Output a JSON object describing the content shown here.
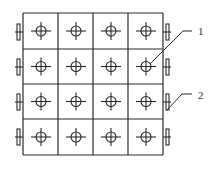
{
  "diagram": {
    "type": "grid-array",
    "rows": 4,
    "cols": 4,
    "stroke_color": "#2a2a2a",
    "background": "#ffffff",
    "grid": {
      "x_lines": [
        23,
        58,
        93,
        128,
        163
      ],
      "y_lines": [
        13,
        49,
        84,
        119,
        155
      ]
    },
    "cell_symbol": "circle-crosshair-icon",
    "edge_connectors": {
      "left_y": [
        32,
        67,
        102,
        137
      ],
      "right_y": [
        32,
        67,
        102,
        137
      ]
    },
    "callouts": [
      {
        "id": "1",
        "text": "1",
        "x": 198,
        "y": 26,
        "target": "cell-r2-c4"
      },
      {
        "id": "2",
        "text": "2",
        "x": 198,
        "y": 90,
        "target": "right-connector-row-3"
      }
    ]
  }
}
